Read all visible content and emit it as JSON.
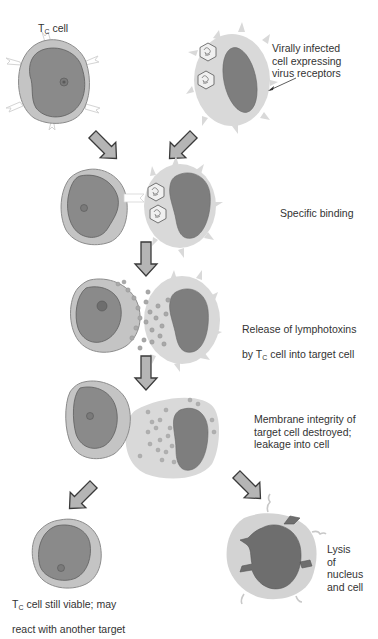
{
  "diagram": {
    "colors": {
      "background": "#ffffff",
      "tc_cytoplasm": "#c4c4c4",
      "tc_nucleus": "#8a8a8a",
      "target_cytoplasm": "#d9d9d9",
      "target_nucleus": "#7e7e7e",
      "arrow_fill": "#b5b5b5",
      "arrow_stroke": "#3a3a3a",
      "granule": "#a9a9a9",
      "text": "#333333"
    },
    "labels": {
      "tc_cell_main": "T",
      "tc_cell_sub": "C",
      "tc_cell_suffix": " cell",
      "virally_infected": "Virally infected\ncell expressing\nvirus receptors",
      "specific_binding": "Specific binding",
      "release_line1": "Release of lymphotoxins",
      "release_line2_pre": "by T",
      "release_line2_sub": "C",
      "release_line2_post": " cell into target cell",
      "membrane": "Membrane integrity of\ntarget cell destroyed;\nleakage into cell",
      "viable_line1_pre": "T",
      "viable_line1_sub": "C",
      "viable_line1_post": " cell still viable; may",
      "viable_line2": "react with another target",
      "lysis": "Lysis\nof\nnucleus\nand cell"
    },
    "stages": [
      {
        "step": 1,
        "name": "initial-cells"
      },
      {
        "step": 2,
        "name": "specific-binding"
      },
      {
        "step": 3,
        "name": "lymphotoxin-release"
      },
      {
        "step": 4,
        "name": "membrane-destroyed"
      },
      {
        "step": 5,
        "name": "outcomes"
      }
    ]
  }
}
